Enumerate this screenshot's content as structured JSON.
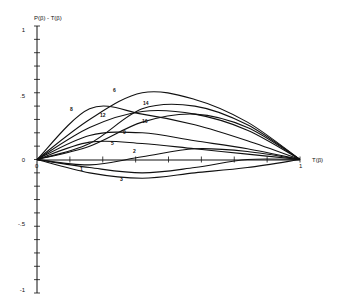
{
  "chart_data": {
    "type": "line",
    "title": "",
    "ylabel": "P(β) - T(β)",
    "xlabel": "T(β)",
    "ylim": [
      -1,
      1
    ],
    "xlim": [
      0,
      1
    ],
    "grid": false,
    "legend": "none (curves labeled inline)",
    "y_ticks": [
      "1",
      ".5",
      "0",
      "-.5",
      "-1"
    ],
    "x_tick_labels": [
      "0",
      "1"
    ],
    "series": [
      {
        "name": "1",
        "x": [
          0,
          0.2,
          0.4,
          0.6,
          0.8,
          1.0
        ],
        "values": [
          0,
          -0.06,
          -0.1,
          -0.06,
          0.0,
          0
        ]
      },
      {
        "name": "2",
        "x": [
          0,
          0.2,
          0.4,
          0.6,
          0.8,
          1.0
        ],
        "values": [
          0,
          -0.04,
          0.02,
          0.08,
          0.06,
          0
        ]
      },
      {
        "name": "3",
        "x": [
          0,
          0.2,
          0.4,
          0.6,
          0.8,
          1.0
        ],
        "values": [
          0,
          -0.1,
          -0.14,
          -0.1,
          -0.06,
          0
        ]
      },
      {
        "name": "5",
        "x": [
          0,
          0.2,
          0.4,
          0.6,
          0.8,
          1.0
        ],
        "values": [
          0,
          0.13,
          0.12,
          0.08,
          0.04,
          0
        ]
      },
      {
        "name": "6",
        "x": [
          0,
          0.2,
          0.4,
          0.6,
          0.8,
          1.0
        ],
        "values": [
          0,
          0.3,
          0.5,
          0.45,
          0.28,
          0
        ]
      },
      {
        "name": "8",
        "x": [
          0,
          0.2,
          0.4,
          0.6,
          0.8,
          1.0
        ],
        "values": [
          0,
          0.38,
          0.34,
          0.26,
          0.14,
          0
        ]
      },
      {
        "name": "9",
        "x": [
          0,
          0.2,
          0.4,
          0.6,
          0.8,
          1.0
        ],
        "values": [
          0,
          0.18,
          0.2,
          0.14,
          0.08,
          0
        ]
      },
      {
        "name": "12",
        "x": [
          0,
          0.2,
          0.4,
          0.6,
          0.8,
          1.0
        ],
        "values": [
          0,
          0.24,
          0.36,
          0.34,
          0.22,
          0
        ]
      },
      {
        "name": "14",
        "x": [
          0,
          0.2,
          0.4,
          0.6,
          0.8,
          1.0
        ],
        "values": [
          0,
          0.12,
          0.38,
          0.4,
          0.26,
          0
        ]
      },
      {
        "name": "16",
        "x": [
          0,
          0.2,
          0.4,
          0.6,
          0.8,
          1.0
        ],
        "values": [
          0,
          0.1,
          0.28,
          0.34,
          0.24,
          0
        ]
      }
    ]
  },
  "labels": {
    "ylabel": "P(β) - T(β)",
    "xlabel": "T(β)",
    "origin_x": "0",
    "x_end": "1",
    "y_1": "1",
    "y_05": ".5",
    "y_0": "0",
    "y_m05": "-.5",
    "y_m1": "-1"
  }
}
